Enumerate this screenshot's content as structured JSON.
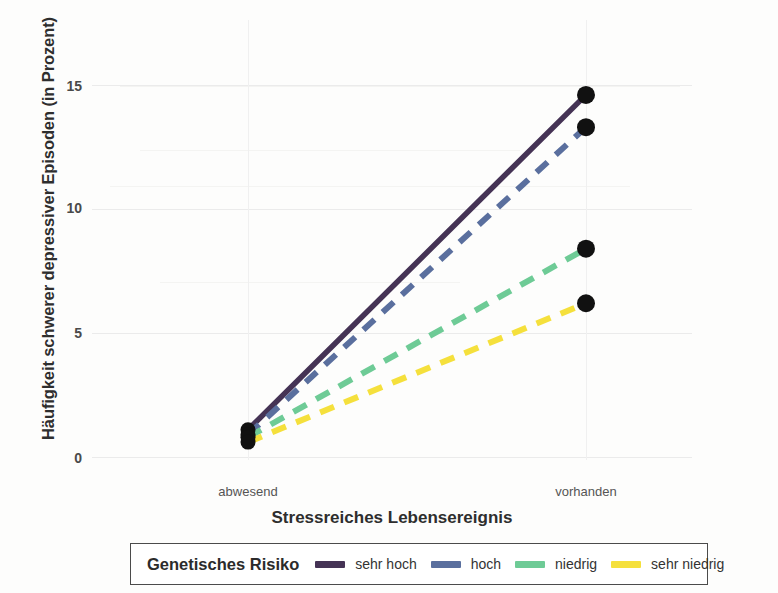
{
  "chart_data": {
    "type": "line",
    "title": "",
    "xlabel": "Stressreiches Lebensereignis",
    "ylabel": "Häufigkeit schwerer depressiver Episoden (in Prozent)",
    "categories": [
      "abwesend",
      "vorhanden"
    ],
    "x_tick_labels": [
      "abwesend",
      "vorhanden"
    ],
    "y_tick_labels": [
      "0",
      "5",
      "10",
      "15"
    ],
    "y_ticks": [
      0,
      5,
      10,
      15
    ],
    "ylim": [
      0,
      16.5
    ],
    "grid": true,
    "legend_position": "bottom",
    "legend_title": "Genetisches Risiko",
    "series": [
      {
        "name": "sehr hoch",
        "values": [
          1.1,
          14.6
        ],
        "color": "#453355",
        "style": "solid",
        "markers": true
      },
      {
        "name": "hoch",
        "values": [
          0.9,
          13.3
        ],
        "color": "#5a6f9e",
        "style": "dashed",
        "markers": true
      },
      {
        "name": "niedrig",
        "values": [
          0.8,
          8.4
        ],
        "color": "#6ecb96",
        "style": "dashed",
        "markers": true
      },
      {
        "name": "sehr niedrig",
        "values": [
          0.6,
          6.2
        ],
        "color": "#f5e03c",
        "style": "dashed",
        "markers": true
      }
    ],
    "marker_color": "#111111"
  },
  "legend": {
    "title": "Genetisches Risiko",
    "entries": [
      {
        "label": "sehr hoch",
        "color": "#453355"
      },
      {
        "label": "hoch",
        "color": "#5a6f9e"
      },
      {
        "label": "niedrig",
        "color": "#6ecb96"
      },
      {
        "label": "sehr niedrig",
        "color": "#f5e03c"
      }
    ]
  },
  "axes": {
    "y_title": "Häufigkeit schwerer depressiver Episoden (in Prozent)",
    "x_title": "Stressreiches Lebensereignis",
    "y_tick_0": "0",
    "y_tick_1": "5",
    "y_tick_2": "10",
    "y_tick_3": "15",
    "x_tick_0": "abwesend",
    "x_tick_1": "vorhanden"
  }
}
